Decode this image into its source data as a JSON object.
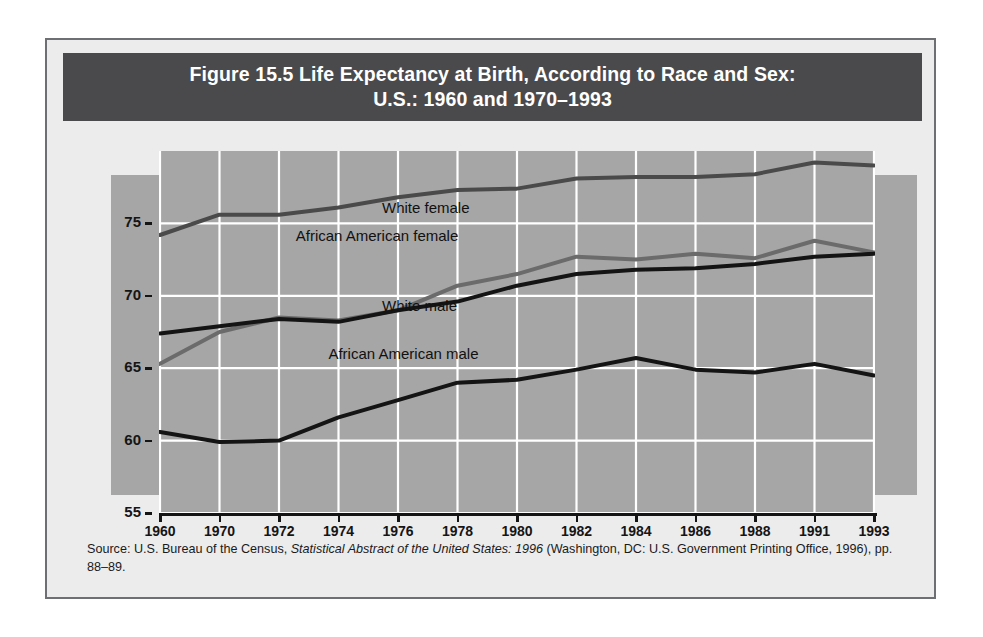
{
  "title": {
    "line1": "Figure 15.5  Life Expectancy at Birth, According to Race and Sex:",
    "line2": "U.S.: 1960 and 1970–1993"
  },
  "axis": {
    "ylabel": "Expected age",
    "yticks": [
      "55",
      "60",
      "65",
      "70",
      "75"
    ],
    "xticks": [
      "1960",
      "1970",
      "1972",
      "1974",
      "1976",
      "1978",
      "1980",
      "1982",
      "1984",
      "1986",
      "1988",
      "1991",
      "1993"
    ]
  },
  "series_labels": {
    "white_female": "White female",
    "african_american_female": "African American female",
    "white_male": "White male",
    "african_american_male": "African American male"
  },
  "source": {
    "prefix": "Source: U.S. Bureau of the Census, ",
    "italic": "Statistical Abstract of the United States: 1996",
    "suffix": " (Washington, DC: U.S. Government Printing Office, 1996), pp. 88–89."
  },
  "colors": {
    "title_band": "#4a4a4c",
    "plot_background": "#a6a6a6",
    "frame_background": "#ececed",
    "gridline": "#ffffff",
    "white_female_line": "#4a4a4a",
    "african_american_female_line": "#6b6b6b",
    "white_male_line": "#141414",
    "african_american_male_line": "#141414"
  },
  "chart_data": {
    "type": "line",
    "title": "Figure 15.5  Life Expectancy at Birth, According to Race and Sex: U.S.: 1960 and 1970–1993",
    "xlabel": "",
    "ylabel": "Expected age",
    "categories": [
      "1960",
      "1970",
      "1972",
      "1974",
      "1976",
      "1978",
      "1980",
      "1982",
      "1984",
      "1986",
      "1988",
      "1991",
      "1993"
    ],
    "ylim": [
      55,
      80
    ],
    "ytick_values": [
      55,
      60,
      65,
      70,
      75
    ],
    "grid": true,
    "legend": "inline-labels",
    "series": [
      {
        "name": "White female",
        "color": "#4a4a4a",
        "values": [
          74.2,
          75.6,
          75.6,
          76.1,
          76.8,
          77.3,
          77.4,
          78.1,
          78.2,
          78.2,
          78.4,
          79.2,
          79.0
        ]
      },
      {
        "name": "African American female",
        "color": "#6b6b6b",
        "values": [
          65.3,
          67.5,
          68.5,
          68.3,
          69.0,
          70.7,
          71.5,
          72.7,
          72.5,
          72.9,
          72.6,
          73.8,
          73.0
        ]
      },
      {
        "name": "White male",
        "color": "#141414",
        "values": [
          67.4,
          67.9,
          68.4,
          68.2,
          69.0,
          69.6,
          70.7,
          71.5,
          71.8,
          71.9,
          72.2,
          72.7,
          72.9
        ]
      },
      {
        "name": "African American male",
        "color": "#141414",
        "values": [
          60.6,
          59.9,
          60.0,
          61.6,
          62.8,
          64.0,
          64.2,
          64.9,
          65.7,
          64.9,
          64.7,
          65.3,
          64.5
        ]
      }
    ]
  }
}
